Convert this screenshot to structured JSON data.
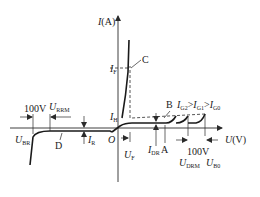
{
  "diagram": {
    "axes": {
      "y_label": "I(A)",
      "x_label": "U(V)",
      "origin_label": "O"
    },
    "point_labels": {
      "A": "A",
      "B": "B",
      "C": "C",
      "D": "D"
    },
    "symbols": {
      "IF": {
        "main": "I",
        "sub": "F"
      },
      "IH": {
        "main": "I",
        "sub": "H"
      },
      "IR": {
        "main": "I",
        "sub": "R"
      },
      "IDR": {
        "main": "I",
        "sub": "DR"
      },
      "UF": {
        "main": "U",
        "sub": "F"
      },
      "UBR": {
        "main": "U",
        "sub": "BR"
      },
      "URRM": {
        "main": "U",
        "sub": "RRM"
      },
      "UDRM": {
        "main": "U",
        "sub": "DRM"
      },
      "UB0": {
        "main": "U",
        "sub": "B0"
      }
    },
    "gate_relation": {
      "IG2": {
        "main": "I",
        "sub": "G2"
      },
      "gt1": ">",
      "IG1": {
        "main": "I",
        "sub": "G1"
      },
      "gt2": ">",
      "IG0": {
        "main": "I",
        "sub": "G0"
      }
    },
    "margin_left": "100V",
    "margin_right": "100V"
  }
}
